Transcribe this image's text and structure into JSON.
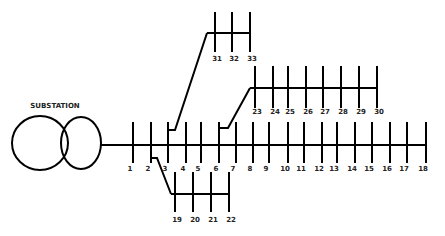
{
  "diagram": {
    "substation_label": "SUBSTATION",
    "line_color": "#000000",
    "text_color": "#222222",
    "main_feeder": {
      "y": 145,
      "x_start": 101,
      "x_end": 427,
      "bar_top": 122,
      "bar_bottom": 163,
      "label_y": 171,
      "buses": [
        {
          "id": "1",
          "x": 133
        },
        {
          "id": "2",
          "x": 151
        },
        {
          "id": "3",
          "x": 168
        },
        {
          "id": "4",
          "x": 186
        },
        {
          "id": "5",
          "x": 201
        },
        {
          "id": "6",
          "x": 219
        },
        {
          "id": "7",
          "x": 236
        },
        {
          "id": "8",
          "x": 253
        },
        {
          "id": "9",
          "x": 269
        },
        {
          "id": "10",
          "x": 288
        },
        {
          "id": "11",
          "x": 304
        },
        {
          "id": "12",
          "x": 322
        },
        {
          "id": "13",
          "x": 337
        },
        {
          "id": "14",
          "x": 355
        },
        {
          "id": "15",
          "x": 372
        },
        {
          "id": "16",
          "x": 390
        },
        {
          "id": "17",
          "x": 407
        },
        {
          "id": "18",
          "x": 426
        }
      ]
    },
    "lateral_19_22": {
      "from_bus": "2",
      "y": 194,
      "x_start": 171,
      "x_end": 229,
      "bar_top": 172,
      "bar_bottom": 212,
      "label_y": 222,
      "path": "151,158 157,158 171,194",
      "buses": [
        {
          "id": "19",
          "x": 175
        },
        {
          "id": "20",
          "x": 193
        },
        {
          "id": "21",
          "x": 211
        },
        {
          "id": "22",
          "x": 229
        }
      ]
    },
    "lateral_23_30": {
      "from_bus": "6",
      "y": 88,
      "x_start": 250,
      "x_end": 378,
      "bar_top": 66,
      "bar_bottom": 108,
      "label_y": 114,
      "path": "219,128 228,128 250,88",
      "buses": [
        {
          "id": "23",
          "x": 255
        },
        {
          "id": "24",
          "x": 273
        },
        {
          "id": "25",
          "x": 288
        },
        {
          "id": "26",
          "x": 306
        },
        {
          "id": "27",
          "x": 323
        },
        {
          "id": "28",
          "x": 341
        },
        {
          "id": "29",
          "x": 359
        },
        {
          "id": "30",
          "x": 377
        }
      ]
    },
    "lateral_31_33": {
      "from_bus": "3",
      "y": 33,
      "x_start": 207,
      "x_end": 251,
      "bar_top": 12,
      "bar_bottom": 52,
      "label_y": 61,
      "path": "168,130 175,130 207,33",
      "buses": [
        {
          "id": "31",
          "x": 215
        },
        {
          "id": "32",
          "x": 232
        },
        {
          "id": "33",
          "x": 250
        }
      ]
    }
  }
}
